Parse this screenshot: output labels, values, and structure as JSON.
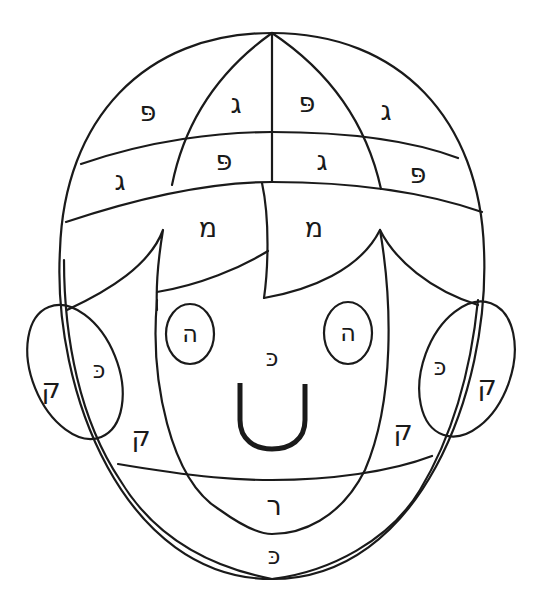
{
  "colors": {
    "line": "#1a1a1a",
    "background": "#ffffff"
  },
  "regions": {
    "cap_top_left_outer": "פּ",
    "cap_top_left_inner": "ג",
    "cap_top_right_inner": "פּ",
    "cap_top_right_outer": "ג",
    "cap_band_left_outer": "ג",
    "cap_band_left_inner": "פּ",
    "cap_band_right_inner": "ג",
    "cap_band_right_outer": "פּ",
    "hair_left": "מ",
    "hair_right": "מ",
    "eye_left": "ה",
    "eye_right": "ה",
    "nose": "כּ",
    "ear_left_outer": "ק",
    "ear_left_inner": "כּ",
    "ear_right_inner": "כּ",
    "ear_right_outer": "ק",
    "cheek_left": "ק",
    "cheek_right": "ק",
    "neck": "ר",
    "chin_band": "כּ"
  }
}
